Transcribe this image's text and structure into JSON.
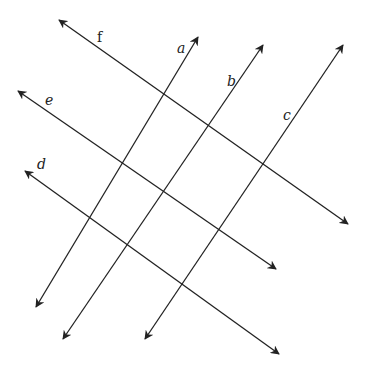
{
  "diagram": {
    "stroke_color": "#222222",
    "lines": [
      {
        "label": "f",
        "x1": 59,
        "y1": 20,
        "x2": 348,
        "y2": 224,
        "label_x": 97,
        "label_y": 30
      },
      {
        "label": "e",
        "x1": 18,
        "y1": 91,
        "x2": 276,
        "y2": 269,
        "label_x": 45,
        "label_y": 93
      },
      {
        "label": "d",
        "x1": 25,
        "y1": 171,
        "x2": 279,
        "y2": 354,
        "label_x": 37,
        "label_y": 157
      },
      {
        "label": "a",
        "x1": 198,
        "y1": 37,
        "x2": 36,
        "y2": 307,
        "label_x": 177,
        "label_y": 41
      },
      {
        "label": "b",
        "x1": 263,
        "y1": 45,
        "x2": 63,
        "y2": 339,
        "label_x": 227,
        "label_y": 74
      },
      {
        "label": "c",
        "x1": 343,
        "y1": 45,
        "x2": 145,
        "y2": 339,
        "label_x": 283,
        "label_y": 108
      }
    ]
  }
}
